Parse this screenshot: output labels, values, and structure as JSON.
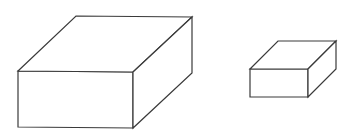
{
  "canvas": {
    "width": 353,
    "height": 135,
    "background": "#ffffff",
    "stroke": "#3a3a3a",
    "stroke_width": 1.2
  },
  "shapes": [
    {
      "name": "large-box",
      "front": [
        [
          18,
          71
        ],
        [
          133,
          72
        ],
        [
          133,
          128
        ],
        [
          18,
          127
        ]
      ],
      "top": [
        [
          18,
          71
        ],
        [
          76,
          16
        ],
        [
          192,
          17
        ],
        [
          133,
          72
        ]
      ],
      "side": [
        [
          133,
          72
        ],
        [
          192,
          17
        ],
        [
          192,
          73
        ],
        [
          133,
          128
        ]
      ]
    },
    {
      "name": "small-box",
      "front": [
        [
          250,
          69
        ],
        [
          308,
          69
        ],
        [
          308,
          97
        ],
        [
          250,
          97
        ]
      ],
      "top": [
        [
          250,
          69
        ],
        [
          278,
          41
        ],
        [
          336,
          41
        ],
        [
          308,
          69
        ]
      ],
      "side": [
        [
          308,
          69
        ],
        [
          336,
          41
        ],
        [
          336,
          69
        ],
        [
          308,
          97
        ]
      ]
    }
  ]
}
